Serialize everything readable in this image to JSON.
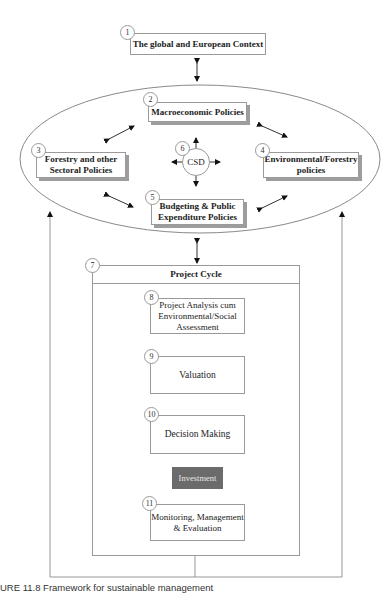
{
  "diagram": {
    "context": {
      "number": "1",
      "label": "The global and European Context"
    },
    "macro": {
      "number": "2",
      "label": "Macroeconomic Policies"
    },
    "forestry_sectoral": {
      "number": "3",
      "label_line1": "Forestry and other",
      "label_line2": "Sectoral Policies"
    },
    "environmental": {
      "number": "4",
      "label_line1": "Environmental/Forestry",
      "label_line2": "policies"
    },
    "budgeting": {
      "number": "5",
      "label_line1": "Budgeting & Public",
      "label_line2": "Expenditure Policies"
    },
    "csd": {
      "number": "6",
      "label": "CSD"
    },
    "project_cycle": {
      "number": "7",
      "label": "Project Cycle"
    },
    "project_analysis": {
      "number": "8",
      "label_line1": "Project Analysis cum",
      "label_line2": "Environmental/Social",
      "label_line3": "Assessment"
    },
    "valuation": {
      "number": "9",
      "label": "Valuation"
    },
    "decision": {
      "number": "10",
      "label": "Decision Making"
    },
    "investment": {
      "label": "Investment",
      "color": "#6b6b6b"
    },
    "monitoring": {
      "number": "11",
      "label_line1": "Monitoring, Management",
      "label_line2": "& Evaluation"
    }
  },
  "caption": "URE 11.8   Framework for sustainable management"
}
